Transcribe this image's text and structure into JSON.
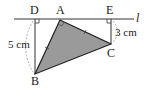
{
  "diagram": {
    "type": "geometry",
    "line_label": "l",
    "points": {
      "D": {
        "label": "D",
        "x": 35,
        "y": 19
      },
      "A": {
        "label": "A",
        "x": 60,
        "y": 20
      },
      "E": {
        "label": "E",
        "x": 111,
        "y": 19
      },
      "C": {
        "label": "C",
        "x": 111,
        "y": 44
      },
      "B": {
        "label": "B",
        "x": 35,
        "y": 74
      }
    },
    "measurements": {
      "BD": "5 cm",
      "CE": "3 cm"
    },
    "triangle": [
      "A",
      "B",
      "C"
    ],
    "right_angles": [
      "D",
      "E",
      "A"
    ],
    "equal_marks": [
      "AB",
      "AC"
    ],
    "colors": {
      "fill": "#9a9a9a",
      "stroke": "#222222",
      "dashed": "#999999"
    }
  }
}
